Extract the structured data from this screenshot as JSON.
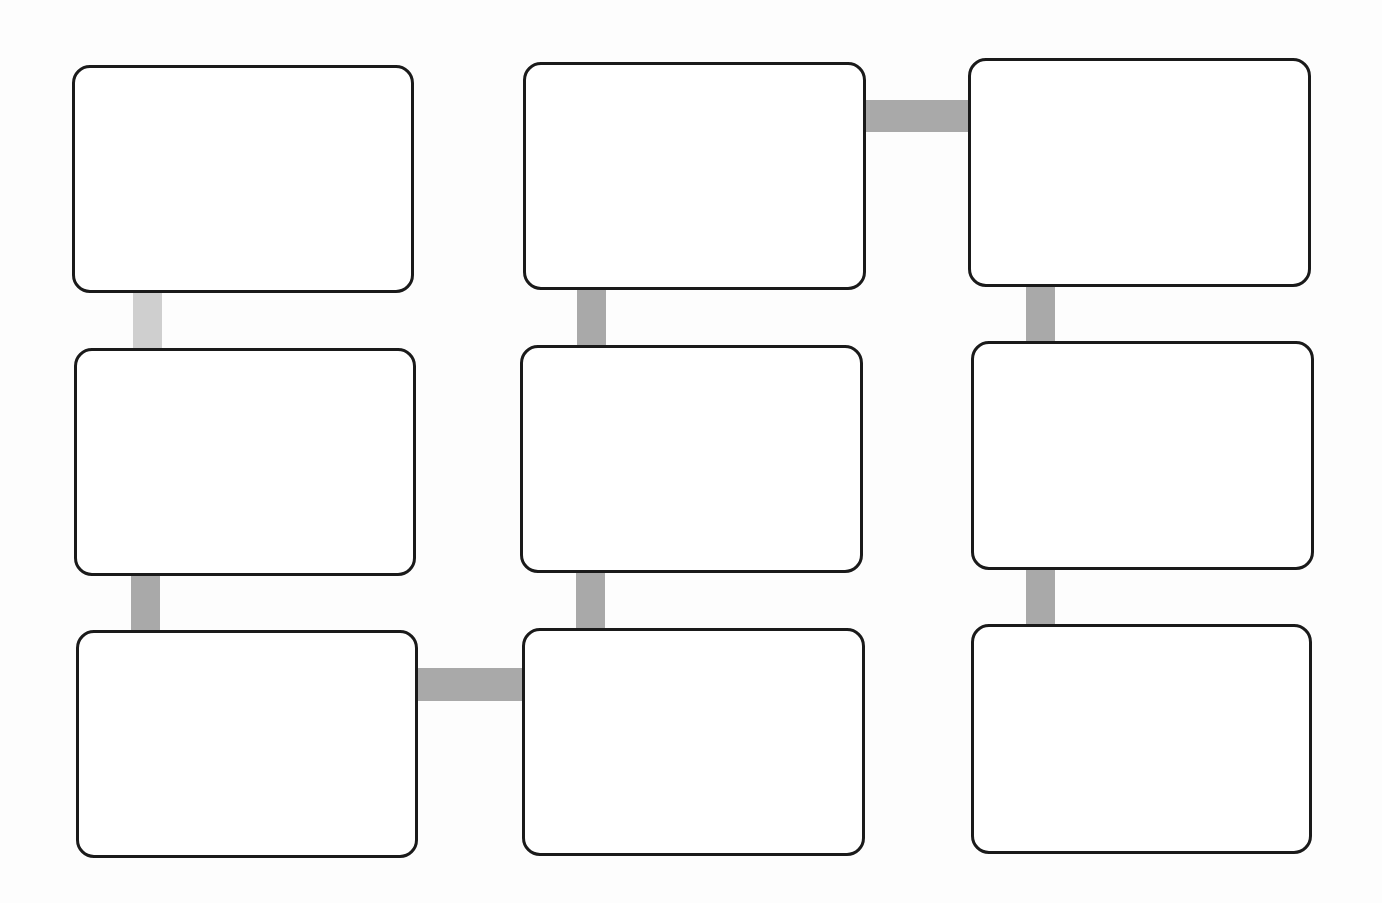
{
  "diagram": {
    "type": "serpentine-flow-template",
    "layout": "3x3 grid of empty rounded boxes",
    "colors": {
      "box_border": "#1a1a1a",
      "box_fill": "#ffffff",
      "connector": "#a9a9a9",
      "connector_light": "#cfcfcf",
      "background": "#fdfdfd"
    },
    "nodes": [
      {
        "id": "r1c1",
        "label": ""
      },
      {
        "id": "r2c1",
        "label": ""
      },
      {
        "id": "r3c1",
        "label": ""
      },
      {
        "id": "r3c2",
        "label": ""
      },
      {
        "id": "r2c2",
        "label": ""
      },
      {
        "id": "r1c2",
        "label": ""
      },
      {
        "id": "r1c3",
        "label": ""
      },
      {
        "id": "r2c3",
        "label": ""
      },
      {
        "id": "r3c3",
        "label": ""
      }
    ],
    "edges": [
      {
        "from": "r1c1",
        "to": "r2c1"
      },
      {
        "from": "r2c1",
        "to": "r3c1"
      },
      {
        "from": "r3c1",
        "to": "r3c2"
      },
      {
        "from": "r3c2",
        "to": "r2c2"
      },
      {
        "from": "r2c2",
        "to": "r1c2"
      },
      {
        "from": "r1c2",
        "to": "r1c3"
      },
      {
        "from": "r1c3",
        "to": "r2c3"
      },
      {
        "from": "r2c3",
        "to": "r3c3"
      }
    ]
  }
}
